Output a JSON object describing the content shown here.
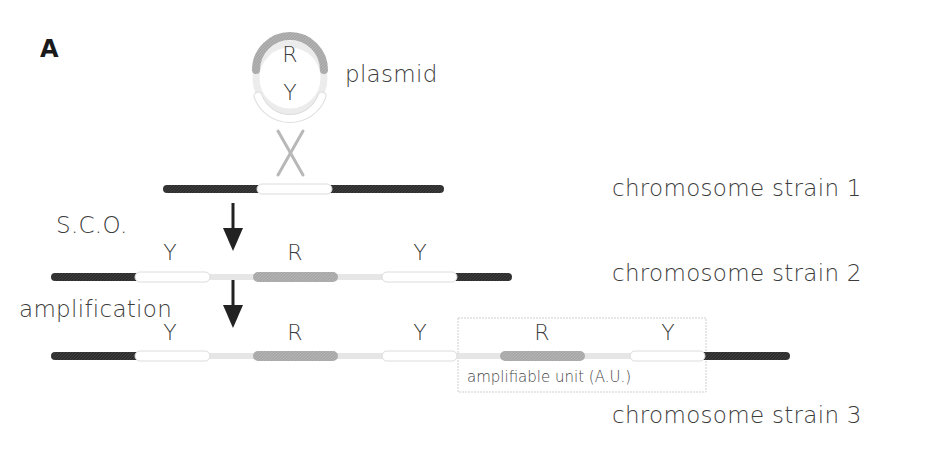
{
  "figure": {
    "panel_label": "A",
    "plasmid": {
      "label": "plasmid",
      "gene_top": "R",
      "gene_bottom": "Y"
    },
    "steps": {
      "sco_label": "S.C.O.",
      "amplification_label": "amplification"
    },
    "strains": [
      {
        "label": "chromosome strain 1"
      },
      {
        "label": "chromosome strain 2",
        "genes": [
          "Y",
          "R",
          "Y"
        ]
      },
      {
        "label": "chromosome strain 3",
        "genes": [
          "Y",
          "R",
          "Y",
          "R",
          "Y"
        ]
      }
    ],
    "amplifiable_unit": {
      "label": "amplifiable unit (A.U.)",
      "genes": [
        "R",
        "Y"
      ]
    },
    "colors": {
      "chromosome": "#2e2e2e",
      "gene_R": "#a8a8a8",
      "gene_Y": "#ffffff",
      "gene_Y_border": "#dcdcdc",
      "linker": "#e6e6e6",
      "crossover": "#b8b8b8",
      "arrow": "#222222",
      "box_border": "#cfcfcf"
    }
  }
}
